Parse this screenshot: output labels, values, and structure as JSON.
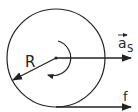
{
  "diagram": {
    "labels": {
      "radius": "R",
      "acceleration": "a",
      "acceleration_subscript": "S",
      "force": "f"
    },
    "colors": {
      "stroke": "#222222",
      "background": "#ffffff"
    }
  }
}
